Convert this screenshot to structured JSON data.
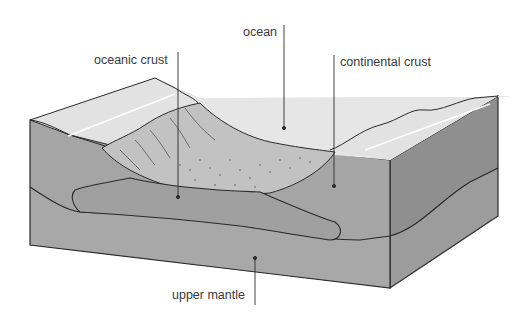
{
  "diagram": {
    "labels": {
      "ocean": "ocean",
      "oceanic_crust": "oceanic crust",
      "continental_crust": "continental crust",
      "upper_mantle": "upper mantle"
    },
    "colors": {
      "sea_surface": "#ececec",
      "land_top": "#e2e2e2",
      "front_face_crust": "#a6a6a6",
      "front_face_mantle": "#a3a3a3",
      "right_face_upper": "#8f8f8f",
      "right_face_lower": "#9c9c9c",
      "basin_floor": "#c4c4c4",
      "outline": "#2a2a2a",
      "label_text": "#3a3a3a"
    }
  }
}
